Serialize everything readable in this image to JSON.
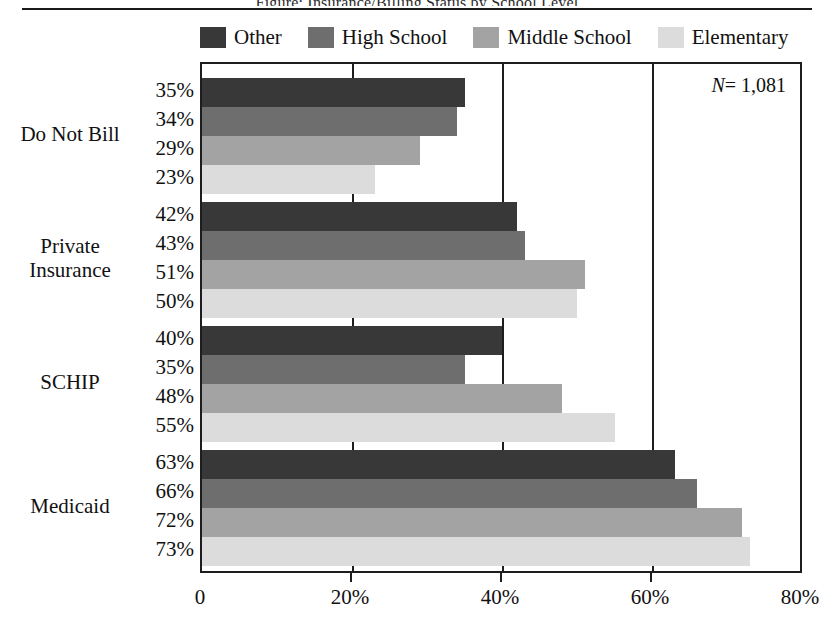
{
  "figure": {
    "cut_title": "Figure: Insurance/Billing Status by School Level",
    "n_annotation_prefix": "N",
    "n_annotation_equals": "=",
    "n_annotation_value": "1,081"
  },
  "legend": {
    "items": [
      {
        "label": "Other",
        "color": "#383838",
        "swatch_name": "legend-swatch-other"
      },
      {
        "label": "High School",
        "color": "#6e6e6e",
        "swatch_name": "legend-swatch-high-school"
      },
      {
        "label": "Middle School",
        "color": "#a3a3a3",
        "swatch_name": "legend-swatch-middle-school"
      },
      {
        "label": "Elementary",
        "color": "#dcdcdc",
        "swatch_name": "legend-swatch-elementary"
      }
    ]
  },
  "axis": {
    "x_tick_labels": [
      "0",
      "20%",
      "40%",
      "60%",
      "80%"
    ],
    "x_tick_values": [
      0,
      20,
      40,
      60,
      80
    ]
  },
  "value_labels": {
    "do_not_bill": [
      "35%",
      "34%",
      "29%",
      "23%"
    ],
    "private_insurance": [
      "42%",
      "43%",
      "51%",
      "50%"
    ],
    "schip": [
      "40%",
      "35%",
      "48%",
      "55%"
    ],
    "medicaid": [
      "63%",
      "66%",
      "72%",
      "73%"
    ]
  },
  "category_labels": {
    "do_not_bill": "Do Not Bill",
    "private_insurance_line1": "Private",
    "private_insurance_line2": "Insurance",
    "schip": "SCHIP",
    "medicaid": "Medicaid"
  },
  "chart_data": {
    "type": "bar",
    "orientation": "horizontal",
    "title": "",
    "xlabel": "",
    "ylabel": "",
    "xlim": [
      0,
      80
    ],
    "grid": true,
    "legend_position": "top",
    "categories": [
      "Do Not Bill",
      "Private Insurance",
      "SCHIP",
      "Medicaid"
    ],
    "series": [
      {
        "name": "Other",
        "color": "#383838",
        "values": [
          35,
          42,
          40,
          63
        ]
      },
      {
        "name": "High School",
        "color": "#6e6e6e",
        "values": [
          34,
          43,
          35,
          66
        ]
      },
      {
        "name": "Middle School",
        "color": "#a3a3a3",
        "values": [
          29,
          51,
          48,
          72
        ]
      },
      {
        "name": "Elementary",
        "color": "#dcdcdc",
        "values": [
          23,
          50,
          55,
          73
        ]
      }
    ],
    "annotations": [
      {
        "text": "N = 1,081",
        "position": "top-right"
      }
    ],
    "x_tick_labels": [
      "0",
      "20%",
      "40%",
      "60%",
      "80%"
    ]
  }
}
